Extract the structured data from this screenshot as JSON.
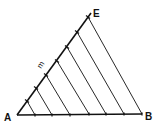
{
  "diagram": {
    "title": "",
    "points": {
      "A": {
        "label": "A",
        "x": 17,
        "y": 115
      },
      "B": {
        "label": "B",
        "x": 142,
        "y": 114
      },
      "E": {
        "label": "E",
        "x": 88,
        "y": 17
      }
    },
    "construction_line_label": "m",
    "divisions": 7,
    "ae_ticks": [
      [
        27,
        101
      ],
      [
        36,
        88
      ],
      [
        46,
        75
      ],
      [
        57,
        61
      ],
      [
        67,
        47
      ],
      [
        77,
        32
      ],
      [
        88,
        17
      ]
    ],
    "ab_ticks": [
      [
        35,
        115
      ],
      [
        52,
        115
      ],
      [
        70,
        115
      ],
      [
        89,
        114
      ],
      [
        106,
        114
      ],
      [
        124,
        114
      ],
      [
        142,
        114
      ]
    ],
    "colors": {
      "stroke": "#111111",
      "background": "#ffffff"
    }
  }
}
